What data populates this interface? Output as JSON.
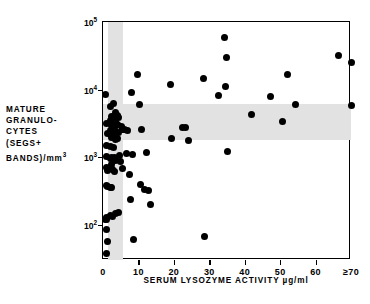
{
  "chart_data": {
    "type": "scatter",
    "title": "",
    "xlabel": "SERUM LYSOZYME ACTIVITY µg/ml",
    "ylabel_lines": [
      "MATURE",
      "GRANULO-",
      "CYTES",
      "(SEGS+",
      "BANDS)/mm"
    ],
    "ylabel_exponent": "3",
    "ylabel_plain": "MATURE GRANULOCYTES (SEGS+BANDS)/mm3",
    "xlim": [
      0,
      70
    ],
    "ylim": [
      30,
      100000
    ],
    "yscale": "log",
    "xticks": [
      0,
      10,
      20,
      30,
      40,
      50,
      60,
      70
    ],
    "xticklabels": [
      "0",
      "10",
      "20",
      "30",
      "40",
      "50",
      "60",
      "≥70"
    ],
    "yticks": [
      100,
      1000,
      10000,
      100000
    ],
    "yticklabels": [
      "10",
      "10",
      "10",
      "10"
    ],
    "ytickexponents": [
      "2",
      "3",
      "4",
      "5"
    ],
    "grid": false,
    "legend": "none",
    "bands": [
      {
        "name": "normal-lysozyme-range",
        "orientation": "vertical",
        "from": 1.4,
        "to": 5.7,
        "color": "#e2e2e2"
      },
      {
        "name": "normal-granulocyte-range",
        "orientation": "horizontal",
        "from": 1800,
        "to": 6200,
        "color": "#e2e2e2"
      }
    ],
    "point_color": "#000000",
    "n_points": 78,
    "points": [
      [
        0.8,
        8400
      ],
      [
        1.1,
        3100
      ],
      [
        1.2,
        2250
      ],
      [
        1.0,
        1500
      ],
      [
        0.9,
        1020
      ],
      [
        1.0,
        700
      ],
      [
        1.2,
        640
      ],
      [
        0.9,
        380
      ],
      [
        1.3,
        370
      ],
      [
        1.0,
        128
      ],
      [
        0.8,
        120
      ],
      [
        1.1,
        118
      ],
      [
        0.9,
        86
      ],
      [
        1.2,
        56
      ],
      [
        1.0,
        38
      ],
      [
        2.0,
        5700
      ],
      [
        2.3,
        4000
      ],
      [
        2.1,
        3450
      ],
      [
        2.4,
        2900
      ],
      [
        2.0,
        2500
      ],
      [
        2.2,
        2150
      ],
      [
        2.5,
        1950
      ],
      [
        2.1,
        1420
      ],
      [
        2.3,
        1000
      ],
      [
        2.0,
        960
      ],
      [
        2.4,
        780
      ],
      [
        2.2,
        690
      ],
      [
        2.6,
        650
      ],
      [
        2.1,
        360
      ],
      [
        2.4,
        350
      ],
      [
        2.0,
        135
      ],
      [
        2.6,
        130
      ],
      [
        3.1,
        6300
      ],
      [
        3.4,
        4600
      ],
      [
        3.0,
        3900
      ],
      [
        3.3,
        3600
      ],
      [
        3.6,
        3300
      ],
      [
        3.2,
        2700
      ],
      [
        3.5,
        2400
      ],
      [
        3.1,
        2050
      ],
      [
        3.4,
        1850
      ],
      [
        3.0,
        1380
      ],
      [
        3.3,
        980
      ],
      [
        3.6,
        900
      ],
      [
        3.2,
        620
      ],
      [
        3.5,
        145
      ],
      [
        4.2,
        4200
      ],
      [
        4.5,
        3800
      ],
      [
        4.0,
        3000
      ],
      [
        4.4,
        2350
      ],
      [
        4.1,
        1900
      ],
      [
        4.6,
        1050
      ],
      [
        4.3,
        150
      ],
      [
        5.2,
        2800
      ],
      [
        5.5,
        2600
      ],
      [
        5.0,
        870
      ],
      [
        5.4,
        680
      ],
      [
        6.2,
        2550
      ],
      [
        6.6,
        1150
      ],
      [
        7.0,
        2500
      ],
      [
        7.4,
        560
      ],
      [
        7.8,
        235
      ],
      [
        8.0,
        9200
      ],
      [
        8.3,
        1080
      ],
      [
        8.6,
        60
      ],
      [
        9.6,
        16500
      ],
      [
        10.2,
        6000
      ],
      [
        10.5,
        400
      ],
      [
        10.9,
        2600
      ],
      [
        11.6,
        330
      ],
      [
        12.2,
        1180
      ],
      [
        12.9,
        320
      ],
      [
        13.4,
        200
      ],
      [
        19.0,
        12000
      ],
      [
        19.3,
        1900
      ],
      [
        22.4,
        2700
      ],
      [
        23.4,
        2700
      ],
      [
        24.2,
        1750
      ],
      [
        28.3,
        14500
      ],
      [
        28.6,
        66
      ],
      [
        32.6,
        8300
      ],
      [
        34.3,
        58000
      ],
      [
        34.6,
        11200
      ],
      [
        34.9,
        30000
      ],
      [
        35.2,
        1230
      ],
      [
        42.0,
        4300
      ],
      [
        47.3,
        7800
      ],
      [
        50.6,
        3350
      ],
      [
        52.2,
        16500
      ],
      [
        54.3,
        6000
      ],
      [
        66.5,
        32000
      ],
      [
        70.0,
        25000
      ],
      [
        70.0,
        5800
      ]
    ]
  }
}
